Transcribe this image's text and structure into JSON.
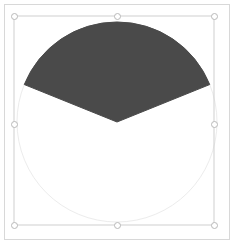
{
  "document": {
    "title": "Pie Wedge Selection",
    "canvas_width": 235,
    "canvas_height": 247,
    "background_color": "#ffffff",
    "page_frame_color": "#d8d8d8"
  },
  "shape": {
    "name": "pie-wedge",
    "type": "pie",
    "fill_color": "#4a4a4a",
    "stroke_color": "#4a4a4a",
    "center_x": 117,
    "center_y": 122,
    "radius": 100,
    "start_angle_deg": 202,
    "end_angle_deg": 338,
    "sweep_deg": 136
  },
  "guide_circle": {
    "name": "guide-circle",
    "stroke_color": "#ececec",
    "center_x": 117,
    "center_y": 122,
    "radius": 100
  },
  "selection": {
    "name": "selection-bounding-box",
    "stroke_color": "#cfcfcf",
    "left": 14,
    "top": 16,
    "right": 214,
    "bottom": 225,
    "handle_fill": "#ffffff",
    "handle_stroke": "#b9b9b9",
    "handles": [
      {
        "label": "top-left",
        "x": 14,
        "y": 16
      },
      {
        "label": "top-center",
        "x": 117,
        "y": 16
      },
      {
        "label": "top-right",
        "x": 214,
        "y": 16
      },
      {
        "label": "middle-left",
        "x": 14,
        "y": 124
      },
      {
        "label": "middle-right",
        "x": 214,
        "y": 124
      },
      {
        "label": "bottom-left",
        "x": 14,
        "y": 225
      },
      {
        "label": "bottom-center",
        "x": 117,
        "y": 225
      },
      {
        "label": "bottom-right",
        "x": 214,
        "y": 225
      }
    ]
  }
}
